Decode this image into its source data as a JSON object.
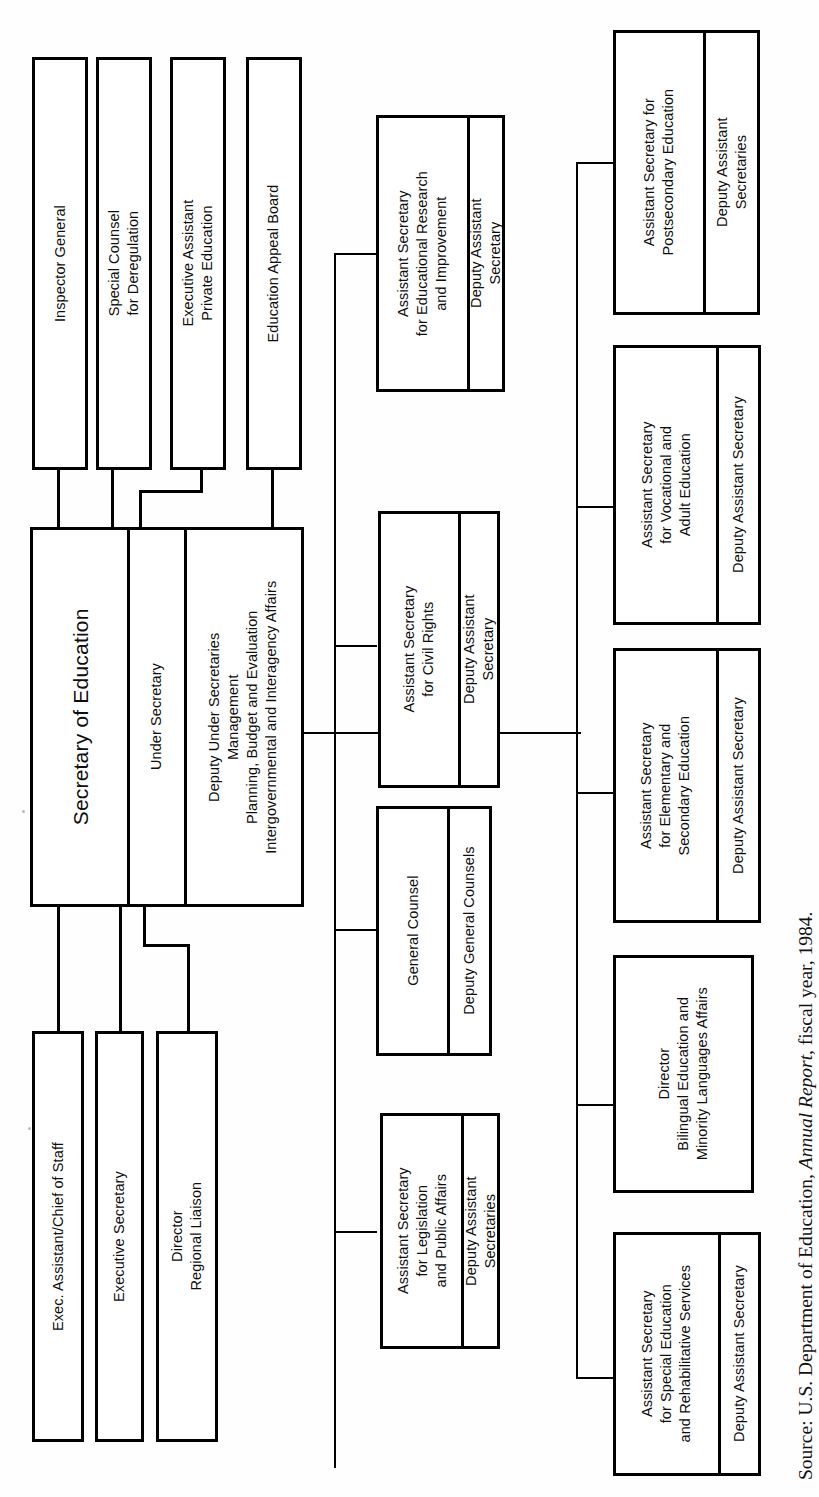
{
  "chart_title": "U.S. Department of Education Organization Chart",
  "orientation": "rotated-90-counterclockwise",
  "source": {
    "prefix": "Source: U.S. Department of Education, ",
    "italic": "Annual Report",
    "suffix": ", fiscal year, 1984."
  },
  "root": {
    "title": "Secretary of Education",
    "second": "Under Secretary",
    "under_secretaries_block": [
      "Deputy Under Secretaries",
      "Management",
      "Planning, Budget and Evaluation",
      "Intergovernmental and Interagency Affairs"
    ]
  },
  "staff_top": [
    {
      "id": "inspector-general",
      "lines": [
        "Inspector General"
      ]
    },
    {
      "id": "special-counsel",
      "lines": [
        "Special Counsel",
        "for Deregulation"
      ]
    },
    {
      "id": "executive-assistant",
      "lines": [
        "Executive Assistant",
        "Private Education"
      ]
    },
    {
      "id": "education-appeal-board",
      "lines": [
        "Education Appeal Board"
      ]
    }
  ],
  "staff_bottom": [
    {
      "id": "exec-assistant-chief-of-staff",
      "lines": [
        "Exec. Assistant/Chief of Staff"
      ]
    },
    {
      "id": "executive-secretary",
      "lines": [
        "Executive Secretary"
      ]
    },
    {
      "id": "director-regional-liaison",
      "lines": [
        "Director",
        "Regional Liaison"
      ]
    }
  ],
  "middle_column": [
    {
      "id": "educational-research",
      "head": [
        "Assistant Secretary",
        "for Educational Research",
        "and Improvement"
      ],
      "deputy": [
        "Deputy Assistant",
        "Secretary"
      ]
    },
    {
      "id": "civil-rights",
      "head": [
        "Assistant Secretary",
        "for Civil Rights"
      ],
      "deputy": [
        "Deputy Assistant",
        "Secretary"
      ]
    },
    {
      "id": "general-counsel",
      "head": [
        "General Counsel"
      ],
      "deputy": [
        "Deputy General Counsels"
      ]
    },
    {
      "id": "legislation-public-affairs",
      "head": [
        "Assistant Secretary",
        "for Legislation",
        "and Public Affairs"
      ],
      "deputy": [
        "Deputy Assistant",
        "Secretaries"
      ]
    }
  ],
  "right_column": [
    {
      "id": "postsecondary-education",
      "head": [
        "Assistant Secretary for",
        "Postsecondary Education"
      ],
      "deputy": [
        "Deputy Assistant",
        "Secretaries"
      ]
    },
    {
      "id": "vocational-adult-education",
      "head": [
        "Assistant Secretary",
        "for Vocational and",
        "Adult Education"
      ],
      "deputy": [
        "Deputy Assistant Secretary"
      ]
    },
    {
      "id": "elementary-secondary-education",
      "head": [
        "Assistant Secretary",
        "for Elementary and",
        "Secondary Education"
      ],
      "deputy": [
        "Deputy Assistant Secretary"
      ]
    },
    {
      "id": "bilingual-education",
      "head": [
        "Director",
        "Bilingual Education and",
        "Minority Languages Affairs"
      ],
      "deputy": []
    },
    {
      "id": "special-education-rehabilitative-services",
      "head": [
        "Assistant Secretary",
        "for Special Education",
        "and Rehabilitative Services"
      ],
      "deputy": [
        "Deputy Assistant Secretary"
      ]
    }
  ]
}
